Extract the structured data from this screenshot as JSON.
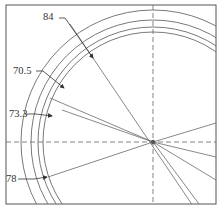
{
  "drawing": {
    "title": "Concentric ring cross-section with radial dimensions",
    "colors": {
      "line": "#6a6a6a",
      "frame": "#555555",
      "text": "#333333"
    },
    "dimensions": [
      {
        "id": "dim-84",
        "label": "84"
      },
      {
        "id": "dim-70-5",
        "label": "70.5"
      },
      {
        "id": "dim-73-3",
        "label": "73.3"
      },
      {
        "id": "dim-78",
        "label": "78"
      }
    ]
  }
}
